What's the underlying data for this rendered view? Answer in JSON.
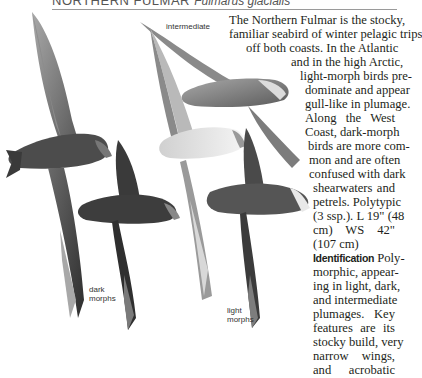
{
  "header": {
    "common_name": "NORTHERN FULMAR",
    "scientific_name": "Fulmarus glacialis"
  },
  "illustration": {
    "labels": {
      "intermediate": "intermediate",
      "dark": [
        "dark",
        "morphs"
      ],
      "light": [
        "light",
        "morphs"
      ]
    }
  },
  "body_text": {
    "lines": [
      "The Northern Fulmar is the stocky,",
      "familiar seabird of winter pelagic trips",
      "off both coasts. In the Atlantic",
      "and in the high Arctic,",
      "light-morph birds pre-",
      "dominate and appear",
      "gull-like in plumage.",
      "Along the West",
      "Coast, dark-morph",
      "birds are more com-",
      "mon and are often",
      "confused with dark",
      "shearwaters and",
      "petrels. Polytypic",
      "(3 ssp.). L 19\" (48",
      "cm) WS 42\"",
      "(107 cm)"
    ],
    "identification_heading": "Identification",
    "identification_lines": [
      "Poly-",
      "morphic, appear-",
      "ing in light, dark,",
      "and intermediate",
      "plumages. Key",
      "features are its",
      "stocky build, very",
      "narrow wings,",
      "and acrobatic"
    ]
  }
}
